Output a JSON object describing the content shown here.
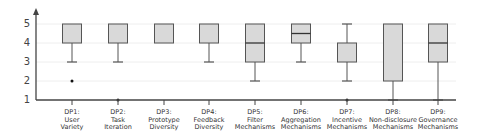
{
  "chart_data": {
    "type": "box",
    "title": "",
    "xlabel": "",
    "ylabel": "",
    "ylim": [
      1,
      5
    ],
    "yticks": [
      1,
      2,
      3,
      4,
      5
    ],
    "grid": true,
    "categories": [
      "DP1: User Variety",
      "DP2: Task Iteration",
      "DP3: Prototype Diversity",
      "DP4: Feedback Diversity",
      "DP5: Filter Mechanisms",
      "DP6: Aggregation Mechanisms",
      "DP7: Incentive Mechanisms",
      "DP8: Non-disclosure Mechanisms",
      "DP9: Governance Mechanisms"
    ],
    "boxes": [
      {
        "label_lines": [
          "DP1:",
          "User",
          "Variety"
        ],
        "q1": 4,
        "median": 5,
        "q3": 5,
        "whisker_low": 3,
        "whisker_high": 5,
        "outliers": [
          2
        ]
      },
      {
        "label_lines": [
          "DP2:",
          "Task",
          "Iteration"
        ],
        "q1": 4,
        "median": 5,
        "q3": 5,
        "whisker_low": 3,
        "whisker_high": 5,
        "outliers": [
          1
        ]
      },
      {
        "label_lines": [
          "DP3:",
          "Prototype",
          "Diversity"
        ],
        "q1": 4,
        "median": 5,
        "q3": 5,
        "whisker_low": 4,
        "whisker_high": 5,
        "outliers": []
      },
      {
        "label_lines": [
          "DP4:",
          "Feedback",
          "Diversity"
        ],
        "q1": 4,
        "median": 5,
        "q3": 5,
        "whisker_low": 3,
        "whisker_high": 5,
        "outliers": []
      },
      {
        "label_lines": [
          "DP5:",
          "Filter",
          "Mechanisms"
        ],
        "q1": 3,
        "median": 4,
        "q3": 5,
        "whisker_low": 2,
        "whisker_high": 5,
        "outliers": []
      },
      {
        "label_lines": [
          "DP6:",
          "Aggregation",
          "Mechanisms"
        ],
        "q1": 4,
        "median": 4.5,
        "q3": 5,
        "whisker_low": 3,
        "whisker_high": 5,
        "outliers": []
      },
      {
        "label_lines": [
          "DP7:",
          "Incentive",
          "Mechanisms"
        ],
        "q1": 3,
        "median": 4,
        "q3": 4,
        "whisker_low": 2,
        "whisker_high": 5,
        "outliers": [
          1
        ]
      },
      {
        "label_lines": [
          "DP8:",
          "Non-disclosure",
          "Mechanisms"
        ],
        "q1": 2,
        "median": 5,
        "q3": 5,
        "whisker_low": 1,
        "whisker_high": 5,
        "outliers": []
      },
      {
        "label_lines": [
          "DP9:",
          "Governance",
          "Mechanisms"
        ],
        "q1": 3,
        "median": 4,
        "q3": 5,
        "whisker_low": 1,
        "whisker_high": 5,
        "outliers": []
      }
    ]
  },
  "style": {
    "box_fill": "#d9d9d9",
    "box_stroke": "#555555",
    "grid_color": "#eeeeee",
    "axis_color": "#444444"
  }
}
